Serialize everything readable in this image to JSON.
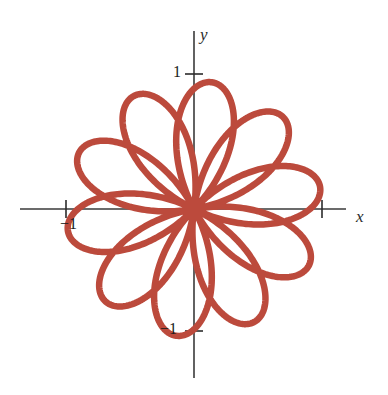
{
  "figure": {
    "name": "polar-rose-curve",
    "width": 388,
    "height": 395,
    "background_color": "#ffffff"
  },
  "axes": {
    "x_label": "x",
    "y_label": "y",
    "axis_color": "#3a3a3a",
    "axis_line_width": 1.6,
    "origin_px": {
      "x": 194,
      "y": 209
    },
    "unit_px": 128,
    "x_axis_extent_px": {
      "start": 20,
      "end": 346
    },
    "y_axis_extent_px": {
      "start": 31,
      "end": 378
    }
  },
  "ticks": {
    "x": [
      {
        "value": -1,
        "label": "−1",
        "px": 66,
        "show_label": true
      },
      {
        "value": 1,
        "label": "1",
        "px": 322,
        "show_label": false
      }
    ],
    "y": [
      {
        "value": 1,
        "label": "1",
        "px": 74,
        "show_label": true
      },
      {
        "value": -1,
        "label": "−1",
        "px": 331,
        "show_label": true
      }
    ],
    "tick_half_length_px": 9,
    "tick_color": "#2b2b2b"
  },
  "chart_data": {
    "type": "line",
    "title": "",
    "xlabel": "x",
    "ylabel": "y",
    "subtitle": "",
    "grid": false,
    "legend": null,
    "annotations": [],
    "coordinate_system": "polar",
    "curve": {
      "name": "five-petal-rose",
      "polar_equation": "r = cos(5θ/2)",
      "petal_count": 5,
      "max_radius": 1.0,
      "theta_range_deg": [
        0,
        720
      ],
      "theta_step_deg": 0.5,
      "rotation_deg": 10,
      "stroke_color": "#bc4a3c",
      "stroke_width_px": 6.5,
      "closed": true
    },
    "xlim": [
      -1.36,
      1.19
    ],
    "ylim": [
      -1.32,
      1.39
    ],
    "tick_labels": {
      "x": [
        "−1",
        "1"
      ],
      "y": [
        "1",
        "−1"
      ]
    },
    "petal_tip_angles_deg": [
      10,
      82,
      154,
      226,
      298
    ],
    "petal_tip_points": [
      {
        "theta_deg": 10,
        "r": 1.0,
        "x": 0.985,
        "y": 0.174
      },
      {
        "theta_deg": 82,
        "r": 1.0,
        "x": 0.139,
        "y": 0.99
      },
      {
        "theta_deg": 154,
        "r": 1.0,
        "x": -0.899,
        "y": 0.438
      },
      {
        "theta_deg": 226,
        "r": 1.0,
        "x": -0.695,
        "y": -0.719
      },
      {
        "theta_deg": 298,
        "r": 1.0,
        "x": 0.469,
        "y": -0.883
      }
    ]
  }
}
